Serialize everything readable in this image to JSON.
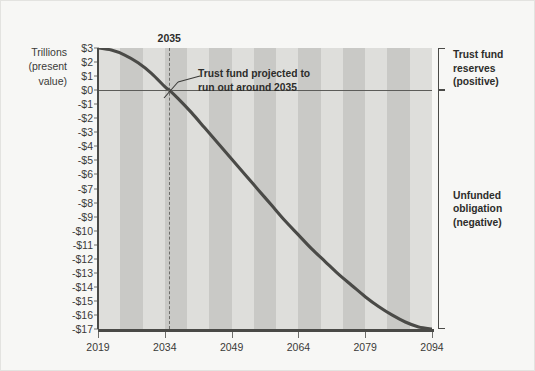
{
  "chart_data": {
    "type": "line",
    "title": "",
    "xlabel": "",
    "ylabel": "Trillions (present value)",
    "ylabel_lines": [
      "Trillions",
      "(present",
      "value)"
    ],
    "grid": false,
    "bands": "alternating 5-year vertical shading",
    "xlim": [
      2019,
      2094
    ],
    "ylim": [
      -17,
      3
    ],
    "x_ticks": [
      2019,
      2034,
      2049,
      2064,
      2079,
      2094
    ],
    "x_tick_labels": [
      "2019",
      "2034",
      "2049",
      "2064",
      "2079",
      "2094"
    ],
    "y_ticks": [
      3,
      2,
      1,
      0,
      -1,
      -2,
      -3,
      -4,
      -5,
      -6,
      -7,
      -8,
      -9,
      -10,
      -11,
      -12,
      -13,
      -14,
      -15,
      -16,
      -17
    ],
    "y_tick_labels": [
      "$3",
      "$2",
      "$1",
      "$0",
      "-$1",
      "-$2",
      "-$3",
      "-$4",
      "-$5",
      "-$6",
      "-$7",
      "-$8",
      "-$9",
      "-$10",
      "-$11",
      "-$12",
      "-$13",
      "-$14",
      "-$15",
      "-$16",
      "-$17"
    ],
    "series": [
      {
        "name": "Social Security trust fund balance",
        "x": [
          2019,
          2022,
          2025,
          2028,
          2031,
          2034,
          2035,
          2037,
          2040,
          2043,
          2046,
          2049,
          2052,
          2055,
          2058,
          2061,
          2064,
          2067,
          2070,
          2073,
          2076,
          2079,
          2082,
          2085,
          2088,
          2091,
          2094
        ],
        "values": [
          3.0,
          2.85,
          2.5,
          1.95,
          1.2,
          0.25,
          0.0,
          -0.6,
          -1.6,
          -2.7,
          -3.8,
          -4.9,
          -6.0,
          -7.1,
          -8.2,
          -9.3,
          -10.3,
          -11.3,
          -12.2,
          -13.1,
          -13.9,
          -14.7,
          -15.4,
          -16.0,
          -16.5,
          -16.85,
          -17.0
        ]
      }
    ],
    "zero_line": 0,
    "annotations": [
      {
        "name": "depletion-marker",
        "label": "2035",
        "x": 2035,
        "type": "dashed-vertical-line"
      },
      {
        "name": "depletion-callout",
        "lines": [
          "Trust fund projected to",
          "run out around 2035"
        ],
        "points_to_x": 2035,
        "points_to_y": 0
      }
    ],
    "brackets": [
      {
        "name": "trust-fund-reserves",
        "lines": [
          "Trust fund",
          "reserves",
          "(positive)"
        ],
        "from": 3,
        "to": 0
      },
      {
        "name": "unfunded-obligation",
        "lines": [
          "Unfunded",
          "obligation",
          "(negative)"
        ],
        "from": 0,
        "to": -17
      }
    ],
    "colors": {
      "curve": "#4a4a47",
      "band_light": "#dededb",
      "band_dark": "#c9c9c6",
      "axis": "#4a4a47",
      "text": "#2d2d2b",
      "background": "#f7f7f5"
    }
  }
}
